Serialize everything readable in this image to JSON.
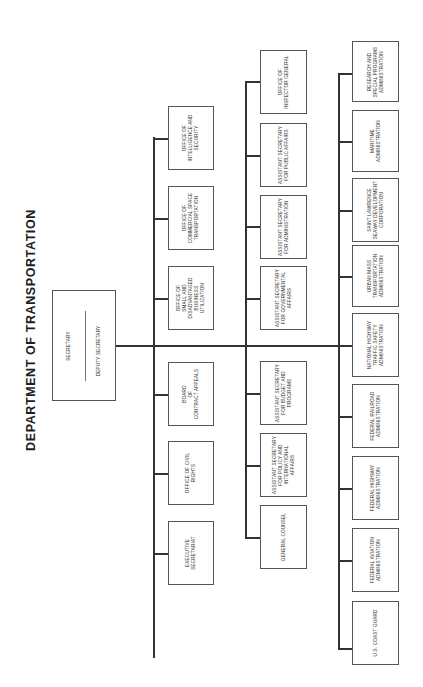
{
  "title": "DEPARTMENT OF TRANSPORTATION",
  "colors": {
    "line": "#333333",
    "box_border": "#555555",
    "text": "#2a2a2a",
    "background": "#ffffff"
  },
  "top": {
    "secretary": "SECRETARY",
    "deputy": "DEPUTY SECRETARY"
  },
  "staff_offices": [
    {
      "label": "OFFICE OF\nINTELLIGENCE AND\nSECURITY"
    },
    {
      "label": "OFFICE OF\nCOMMERCIAL SPACE\nTRANSPORTATION"
    },
    {
      "label": "OFFICE OF\nSMALL AND\nDISADVANTAGED\nBUSINESS\nUTILIZATION"
    },
    {
      "label": "BOARD\nOF\nCONTRACT APPEALS"
    },
    {
      "label": "OFFICE OF CIVIL\nRIGHTS"
    },
    {
      "label": "EXECUTIVE\nSECRETARIAT"
    }
  ],
  "secretarial_officers": [
    {
      "label": "OFFICE OF\nINSPECTOR GENERAL"
    },
    {
      "label": "ASSISTANT SECRETARY\nFOR PUBLIC AFFAIRS"
    },
    {
      "label": "ASSISTANT SECRETARY\nFOR ADMINISTRATION"
    },
    {
      "label": "ASSISTANT SECRETARY\nFOR GOVERNMENTAL\nAFFAIRS"
    },
    {
      "label": "ASSISTANT SECRETARY\nFOR BUDGET AND\nPROGRAMS"
    },
    {
      "label": "ASSISTANT SECRETARY\nFOR POLICY AND\nINTERNATIONAL\nAFFAIRS"
    },
    {
      "label": "GENERAL COUNSEL"
    }
  ],
  "operating_administrations": [
    {
      "label": "RESEARCH AND\nSPECIAL PROGRAMS\nADMINISTRATION"
    },
    {
      "label": "MARITIME\nADMINISTRATION"
    },
    {
      "label": "SAINT LAWRENCE\nSEAWAY DEVELOPMENT\nCORPORATION"
    },
    {
      "label": "URBAN MASS\nTRANSPORTATION\nADMINISTRATION"
    },
    {
      "label": "NATIONAL HIGHWAY\nTRAFFIC SAFETY\nADMINISTRATION"
    },
    {
      "label": "FEDERAL RAILROAD\nADMINISTRATION"
    },
    {
      "label": "FEDERAL HIGHWAY\nADMINISTRATION"
    },
    {
      "label": "FEDERAL AVIATION\nADMINISTRATION"
    },
    {
      "label": "U.S. COAST GUARD"
    }
  ]
}
